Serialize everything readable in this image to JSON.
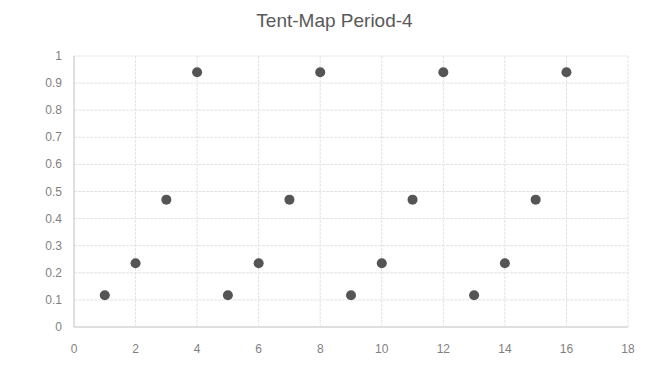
{
  "chart_data": {
    "type": "scatter",
    "title": "Tent-Map Period-4",
    "xlabel": "",
    "ylabel": "",
    "xlim": [
      0,
      18
    ],
    "ylim": [
      0,
      1
    ],
    "x_ticks": [
      "0",
      "2",
      "4",
      "6",
      "8",
      "10",
      "12",
      "14",
      "16",
      "18"
    ],
    "y_ticks": [
      "0",
      "0.1",
      "0.2",
      "0.3",
      "0.4",
      "0.5",
      "0.6",
      "0.7",
      "0.8",
      "0.9",
      "1"
    ],
    "grid": true,
    "legend": null,
    "series": [
      {
        "name": "Series1",
        "color": "#555555",
        "x": [
          1,
          2,
          3,
          4,
          5,
          6,
          7,
          8,
          9,
          10,
          11,
          12,
          13,
          14,
          15,
          16
        ],
        "y": [
          0.117,
          0.235,
          0.47,
          0.94,
          0.117,
          0.235,
          0.47,
          0.94,
          0.117,
          0.235,
          0.47,
          0.94,
          0.117,
          0.235,
          0.47,
          0.94
        ]
      }
    ]
  }
}
